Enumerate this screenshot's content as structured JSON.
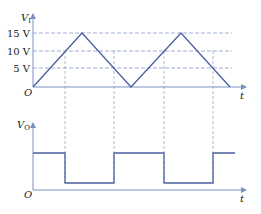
{
  "top_graph": {
    "y_label": "V",
    "y_label_sub": "I",
    "origin_label": "O",
    "x_label": "t",
    "ticks": [
      {
        "label": "15 V",
        "value": 15
      },
      {
        "label": "10 V",
        "value": 10
      },
      {
        "label": "5 V",
        "value": 5
      }
    ],
    "waveform": "triangle",
    "peak_value": 15,
    "min_value": 0
  },
  "bottom_graph": {
    "y_label": "V",
    "y_label_sub": "O",
    "origin_label": "O",
    "x_label": "t",
    "waveform": "square"
  },
  "colors": {
    "line": "#4a5f9e",
    "dashed": "#7d8fc0",
    "axis": "#7d8fc0",
    "text": "#222222"
  }
}
